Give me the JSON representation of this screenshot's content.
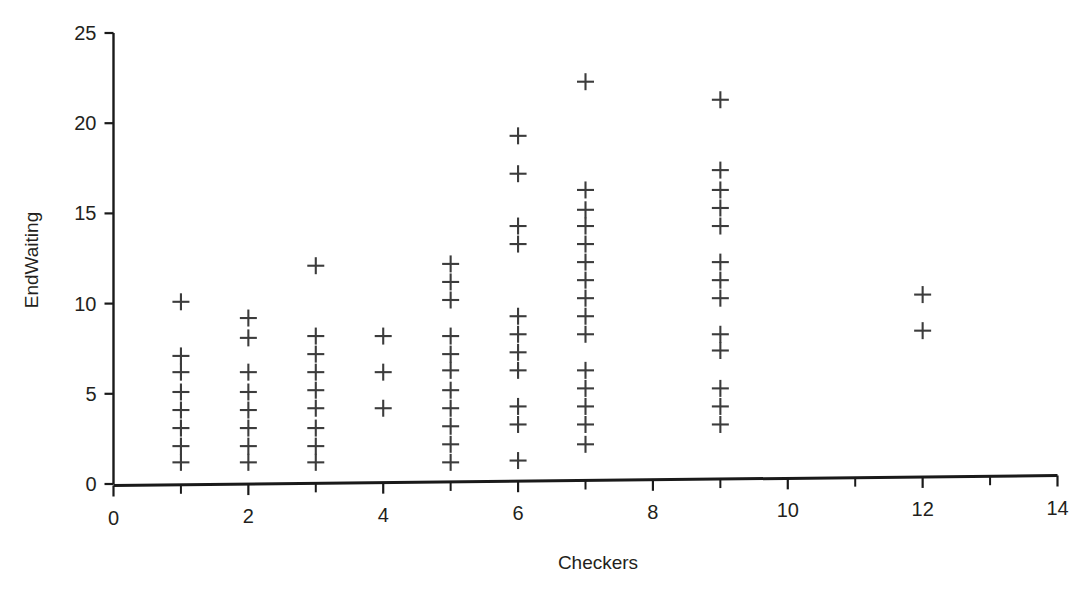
{
  "chart_data": {
    "type": "scatter",
    "title": "",
    "xlabel": "Checkers",
    "ylabel": "EndWaiting",
    "xlim": [
      0,
      14
    ],
    "ylim": [
      0,
      25
    ],
    "grid": false,
    "legend": null,
    "marker": "plus",
    "marker_color": "#3c3c3c",
    "x_ticks_major": [
      0,
      2,
      4,
      6,
      8,
      10,
      12,
      14
    ],
    "x_ticks_minor": [
      1,
      3,
      5,
      7,
      9,
      11,
      13
    ],
    "x_tick_labels": [
      "0",
      "2",
      "4",
      "6",
      "8",
      "10",
      "12",
      "14"
    ],
    "y_ticks": [
      0,
      5,
      10,
      15,
      20,
      25
    ],
    "y_tick_labels": [
      "0",
      "5",
      "10",
      "15",
      "20",
      "25"
    ],
    "points": [
      {
        "x": 1,
        "y": 10.1
      },
      {
        "x": 1,
        "y": 7.1
      },
      {
        "x": 1,
        "y": 6.2
      },
      {
        "x": 1,
        "y": 5.1
      },
      {
        "x": 1,
        "y": 4.1
      },
      {
        "x": 1,
        "y": 3.1
      },
      {
        "x": 1,
        "y": 2.1
      },
      {
        "x": 1,
        "y": 1.2
      },
      {
        "x": 2,
        "y": 9.2
      },
      {
        "x": 2,
        "y": 8.1
      },
      {
        "x": 2,
        "y": 6.2
      },
      {
        "x": 2,
        "y": 5.1
      },
      {
        "x": 2,
        "y": 4.1
      },
      {
        "x": 2,
        "y": 3.1
      },
      {
        "x": 2,
        "y": 2.1
      },
      {
        "x": 2,
        "y": 1.2
      },
      {
        "x": 3,
        "y": 12.1
      },
      {
        "x": 3,
        "y": 8.2
      },
      {
        "x": 3,
        "y": 7.2
      },
      {
        "x": 3,
        "y": 6.2
      },
      {
        "x": 3,
        "y": 5.2
      },
      {
        "x": 3,
        "y": 4.2
      },
      {
        "x": 3,
        "y": 3.1
      },
      {
        "x": 3,
        "y": 2.1
      },
      {
        "x": 3,
        "y": 1.2
      },
      {
        "x": 4,
        "y": 8.2
      },
      {
        "x": 4,
        "y": 6.2
      },
      {
        "x": 4,
        "y": 4.2
      },
      {
        "x": 5,
        "y": 12.2
      },
      {
        "x": 5,
        "y": 11.2
      },
      {
        "x": 5,
        "y": 10.2
      },
      {
        "x": 5,
        "y": 8.2
      },
      {
        "x": 5,
        "y": 7.2
      },
      {
        "x": 5,
        "y": 6.3
      },
      {
        "x": 5,
        "y": 5.2
      },
      {
        "x": 5,
        "y": 4.2
      },
      {
        "x": 5,
        "y": 3.2
      },
      {
        "x": 5,
        "y": 2.2
      },
      {
        "x": 5,
        "y": 1.2
      },
      {
        "x": 6,
        "y": 19.3
      },
      {
        "x": 6,
        "y": 17.2
      },
      {
        "x": 6,
        "y": 14.3
      },
      {
        "x": 6,
        "y": 13.3
      },
      {
        "x": 6,
        "y": 9.3
      },
      {
        "x": 6,
        "y": 8.3
      },
      {
        "x": 6,
        "y": 7.3
      },
      {
        "x": 6,
        "y": 6.3
      },
      {
        "x": 6,
        "y": 4.3
      },
      {
        "x": 6,
        "y": 3.3
      },
      {
        "x": 6,
        "y": 1.3
      },
      {
        "x": 7,
        "y": 22.3
      },
      {
        "x": 7,
        "y": 16.3
      },
      {
        "x": 7,
        "y": 15.2
      },
      {
        "x": 7,
        "y": 14.3
      },
      {
        "x": 7,
        "y": 13.3
      },
      {
        "x": 7,
        "y": 12.3
      },
      {
        "x": 7,
        "y": 11.3
      },
      {
        "x": 7,
        "y": 10.3
      },
      {
        "x": 7,
        "y": 9.3
      },
      {
        "x": 7,
        "y": 8.3
      },
      {
        "x": 7,
        "y": 6.3
      },
      {
        "x": 7,
        "y": 5.3
      },
      {
        "x": 7,
        "y": 4.3
      },
      {
        "x": 7,
        "y": 3.3
      },
      {
        "x": 7,
        "y": 2.2
      },
      {
        "x": 9,
        "y": 21.3
      },
      {
        "x": 9,
        "y": 17.4
      },
      {
        "x": 9,
        "y": 16.3
      },
      {
        "x": 9,
        "y": 15.3
      },
      {
        "x": 9,
        "y": 14.3
      },
      {
        "x": 9,
        "y": 12.3
      },
      {
        "x": 9,
        "y": 11.3
      },
      {
        "x": 9,
        "y": 10.3
      },
      {
        "x": 9,
        "y": 8.3
      },
      {
        "x": 9,
        "y": 7.4
      },
      {
        "x": 9,
        "y": 5.3
      },
      {
        "x": 9,
        "y": 4.3
      },
      {
        "x": 9,
        "y": 3.3
      },
      {
        "x": 12,
        "y": 10.5
      },
      {
        "x": 12,
        "y": 8.5
      }
    ]
  }
}
